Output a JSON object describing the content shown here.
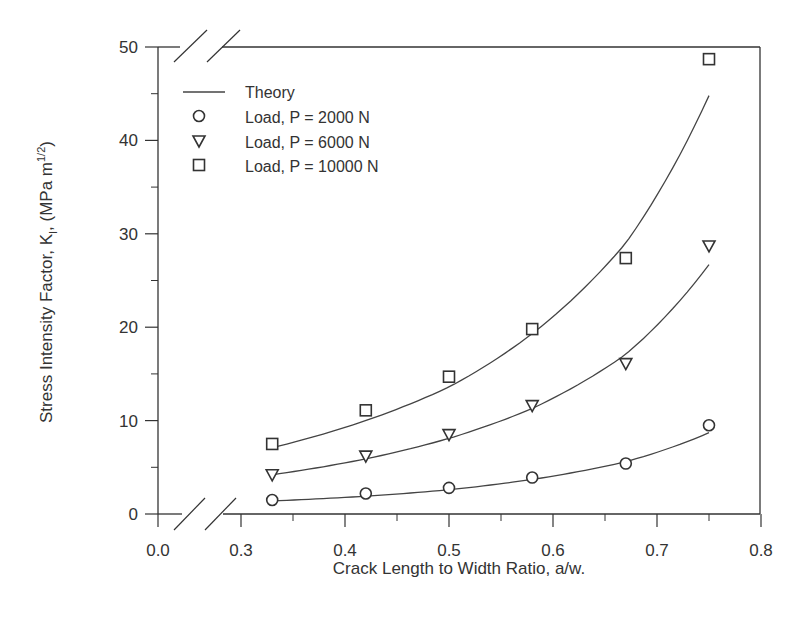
{
  "chart_data": {
    "type": "scatter",
    "title": "",
    "xlabel": "Crack Length to Width Ratio, a/w.",
    "ylabel": "Stress Intensity Factor, K_I, (MPa m^1/2)",
    "ylabel_parts": {
      "main": "Stress Intensity Factor, K",
      "sub": "I",
      "mid": ", (MPa m",
      "sup": "1/2",
      "end": ")"
    },
    "xlim": [
      0.0,
      0.8
    ],
    "ylim": [
      0,
      50
    ],
    "x_axis_break": true,
    "y_axis_break": true,
    "x_ticks": [
      "0.0",
      "0.3",
      "0.4",
      "0.5",
      "0.6",
      "0.7",
      "0.8"
    ],
    "y_ticks": [
      "0",
      "10",
      "20",
      "30",
      "40",
      "50"
    ],
    "grid": false,
    "legend_position": "upper left",
    "x": [
      0.33,
      0.42,
      0.5,
      0.58,
      0.67,
      0.75
    ],
    "series": [
      {
        "name": "Load, P = 2000 N",
        "marker": "circle",
        "values": [
          1.5,
          2.2,
          2.8,
          3.9,
          5.4,
          9.5
        ]
      },
      {
        "name": "Load, P = 6000 N",
        "marker": "triangle-down",
        "values": [
          4.2,
          6.2,
          8.5,
          11.6,
          16.1,
          28.7
        ]
      },
      {
        "name": "Load, P = 10000 N",
        "marker": "square",
        "values": [
          7.5,
          11.1,
          14.7,
          19.8,
          27.4,
          48.7
        ]
      }
    ],
    "theory": {
      "name": "Theory",
      "style": "line",
      "curves": [
        {
          "load": "P = 2000 N",
          "x": [
            0.33,
            0.42,
            0.5,
            0.58,
            0.67,
            0.75
          ],
          "values": [
            1.4,
            1.9,
            2.6,
            3.7,
            5.6,
            8.7
          ]
        },
        {
          "load": "P = 6000 N",
          "x": [
            0.33,
            0.42,
            0.5,
            0.58,
            0.67,
            0.75
          ],
          "values": [
            4.2,
            5.9,
            8.1,
            11.3,
            17.1,
            26.7
          ]
        },
        {
          "load": "P = 10000 N",
          "x": [
            0.33,
            0.42,
            0.5,
            0.58,
            0.67,
            0.75
          ],
          "values": [
            7.1,
            10.0,
            13.6,
            19.3,
            29.0,
            44.8
          ]
        }
      ]
    },
    "legend": [
      "Theory",
      "Load, P = 2000 N",
      "Load, P = 6000 N",
      "Load, P = 10000 N"
    ],
    "colors": {
      "line": "#444444",
      "axis": "#333333",
      "background": "#ffffff"
    }
  }
}
